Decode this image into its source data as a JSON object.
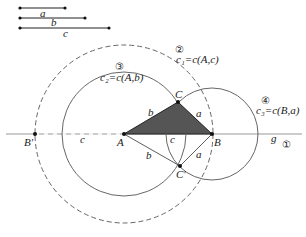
{
  "legend_segments": [
    {
      "label": "a",
      "x1": 20,
      "x2": 65,
      "y": 8
    },
    {
      "label": "b",
      "x1": 20,
      "x2": 85,
      "y": 18
    },
    {
      "label": "c",
      "x1": 20,
      "x2": 109,
      "y": 28
    }
  ],
  "points": {
    "A": {
      "label": "A",
      "x": 124,
      "y": 134
    },
    "B": {
      "label": "B",
      "x": 212,
      "y": 134
    },
    "C": {
      "label": "C",
      "x": 178,
      "y": 102
    },
    "C_prime": {
      "label": "C'",
      "x": 180,
      "y": 166
    },
    "B_prime": {
      "label": "B'",
      "x": 35,
      "y": 134
    }
  },
  "circles": {
    "c1": {
      "label": "c₁=c(A,c)",
      "step": "②",
      "cx": 124,
      "cy": 134,
      "r": 89,
      "style": "dashed"
    },
    "c2": {
      "label": "c₂=c(A,b)",
      "step": "③",
      "cx": 124,
      "cy": 134,
      "r": 62,
      "style": "solid"
    },
    "c3": {
      "label": "c₃=c(B,a)",
      "step": "④",
      "cx": 212,
      "cy": 134,
      "r": 46,
      "style": "solid"
    }
  },
  "line_g": {
    "label": "g",
    "step": "①"
  },
  "side_labels": {
    "b_upper": "b",
    "a_upper": "a",
    "c_mid": "c",
    "c_left": "c",
    "b_lower": "b",
    "a_lower": "a"
  },
  "colors": {
    "triangle_fill": "#555555",
    "stroke": "#333333",
    "line_g": "#999999"
  }
}
